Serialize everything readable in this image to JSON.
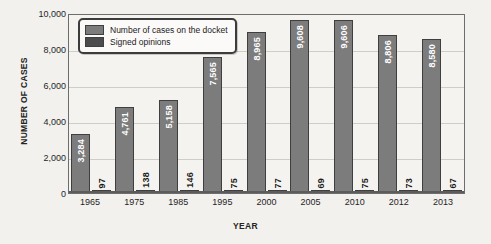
{
  "chart_data": {
    "type": "bar",
    "title": "",
    "xlabel": "YEAR",
    "ylabel": "NUMBER OF CASES",
    "categories": [
      "1965",
      "1975",
      "1985",
      "1995",
      "2000",
      "2005",
      "2010",
      "2012",
      "2013"
    ],
    "series": [
      {
        "name": "Number of cases on the docket",
        "color": "#7c7c7c",
        "values": [
          3284,
          4761,
          5158,
          7565,
          8965,
          9608,
          9606,
          8806,
          8580
        ],
        "labels": [
          "3,284",
          "4,761",
          "5,158",
          "7,565",
          "8,965",
          "9,608",
          "9,606",
          "8,806",
          "8,580"
        ]
      },
      {
        "name": "Signed opinions",
        "color": "#4c4c4c",
        "values": [
          97,
          138,
          146,
          75,
          77,
          69,
          75,
          73,
          67
        ],
        "labels": [
          "97",
          "138",
          "146",
          "75",
          "77",
          "69",
          "75",
          "73",
          "67"
        ]
      }
    ],
    "ylim": [
      0,
      10000
    ],
    "ytick_values": [
      0,
      2000,
      4000,
      6000,
      8000,
      10000
    ],
    "ytick_labels": [
      "0",
      "2,000",
      "4,000",
      "6,000",
      "8,000",
      "10,000"
    ],
    "grid": true,
    "legend_position": "top-left"
  },
  "legend": {
    "items": [
      {
        "label": "Number of cases on the docket",
        "color": "#7c7c7c"
      },
      {
        "label": "Signed opinions",
        "color": "#4c4c4c"
      }
    ]
  },
  "axes": {
    "y_title": "NUMBER OF CASES",
    "x_title": "YEAR"
  }
}
